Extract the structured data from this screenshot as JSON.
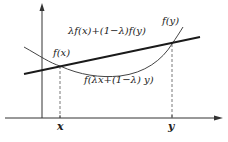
{
  "diagram": {
    "colors": {
      "background": "#ffffff",
      "axis": "#333333",
      "secant": "#1a1a1a",
      "curve": "#444444",
      "dashed": "#555555",
      "text": "#222222"
    },
    "labels": {
      "f_x": "f(x)",
      "f_y": "f(y)",
      "secant": "λf(x)+(1−λ)f(y)",
      "curve_point": "f(λx+(1−λ) y)",
      "x_tick": "x",
      "y_tick": "y"
    },
    "elements": {
      "y_axis": {
        "x": 42,
        "y_bottom": 118,
        "y_top": 5
      },
      "x_axis": {
        "y": 118,
        "x_left": 5,
        "x_right": 222
      },
      "secant_line": {
        "from": [
          24,
          74
        ],
        "to": [
          200,
          37
        ]
      },
      "curve": {
        "points": [
          [
            24,
            47
          ],
          [
            60,
            66
          ],
          [
            110,
            77
          ],
          [
            172,
            44
          ],
          [
            183,
            27
          ]
        ]
      },
      "dashed_x": {
        "x": 60,
        "from_y": 66,
        "to_y": 118
      },
      "dashed_y": {
        "x": 172,
        "from_y": 44,
        "to_y": 118
      }
    }
  }
}
